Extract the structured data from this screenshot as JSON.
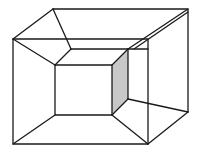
{
  "figure": {
    "stroke_color": "#1a1a1a",
    "shade_color": "#c8c8c8",
    "background": "#ffffff"
  }
}
